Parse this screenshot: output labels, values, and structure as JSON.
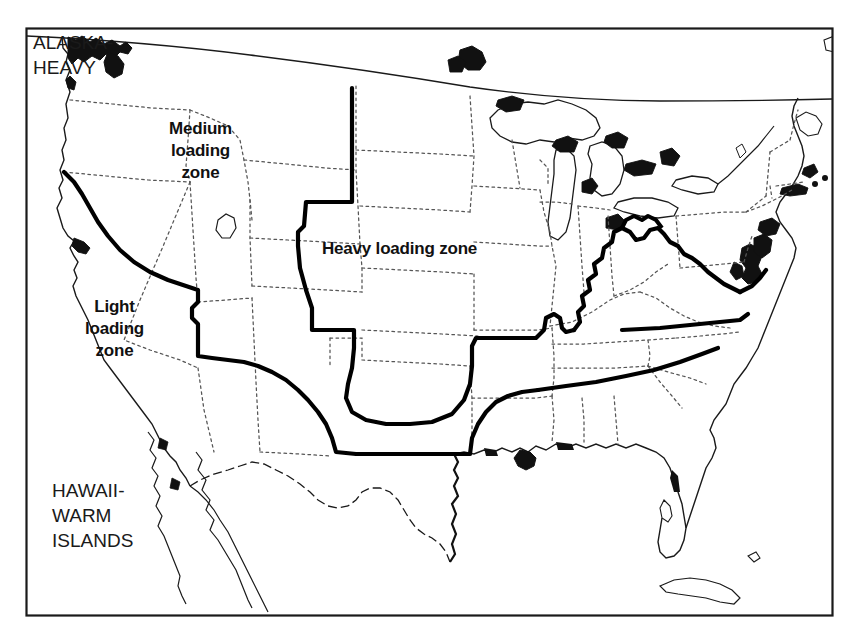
{
  "figure": {
    "kind": "map",
    "frame_color": "#1a1a1a",
    "background_color": "#ffffff",
    "width": 863,
    "height": 642
  },
  "labels": {
    "alaska": "ALASKA-\nHEAVY",
    "hawaii": "HAWAII-\nWARM\nISLANDS",
    "medium_zone": "Medium\nloading\nzone",
    "heavy_zone": "Heavy loading zone",
    "light_zone": "Light\nloading\nzone"
  },
  "zones": [
    {
      "id": "light",
      "name": "Light loading zone",
      "label": "Light\nloading\nzone",
      "region": "Pacific coast (California, western Oregon), desert Southwest, southern Plains and the Gulf / South-Atlantic coastal states",
      "label_position": {
        "x": 114,
        "y": 330
      }
    },
    {
      "id": "medium",
      "name": "Medium loading zone",
      "label": "Medium\nloading\nzone",
      "region": "Pacific Northwest interior, Great Basin, Intermountain West, central Plains transition and the mid-South / lower Appalachian states",
      "label_position": {
        "x": 200,
        "y": 155
      }
    },
    {
      "id": "heavy",
      "name": "Heavy loading zone",
      "label": "Heavy loading zone",
      "region": "Northern Rockies, northern Plains, upper Midwest, Great Lakes, Northeast and the higher Appalachian ridge",
      "label_position": {
        "x": 427,
        "y": 250
      }
    }
  ],
  "notes": [
    {
      "id": "alaska",
      "text": "ALASKA-HEAVY",
      "position": {
        "x": 33,
        "y": 30
      }
    },
    {
      "id": "hawaii",
      "text": "HAWAII-WARM ISLANDS",
      "position": {
        "x": 52,
        "y": 478
      }
    }
  ],
  "line_styles": {
    "zone_boundary": {
      "color": "#000000",
      "weight": "heavy",
      "dash": "solid"
    },
    "state_boundary": {
      "color": "#4a4a4a",
      "weight": "thin",
      "dash": "dotted"
    },
    "coastline": {
      "color": "#1a1a1a",
      "weight": "thin",
      "dash": "solid"
    },
    "frame": {
      "color": "#1a1a1a",
      "weight": "thin",
      "dash": "solid"
    }
  }
}
